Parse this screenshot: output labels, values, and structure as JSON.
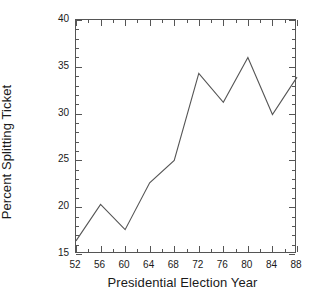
{
  "chart_data": {
    "type": "line",
    "title": "",
    "xlabel": "Presidential Election Year",
    "ylabel": "Percent Splitting Ticket",
    "x": [
      52,
      56,
      60,
      64,
      68,
      72,
      76,
      80,
      84,
      88
    ],
    "categories": [
      "52",
      "56",
      "60",
      "64",
      "68",
      "72",
      "76",
      "80",
      "84",
      "88"
    ],
    "values": [
      16.4,
      20.3,
      17.6,
      22.6,
      25.0,
      34.3,
      31.2,
      36.0,
      29.9,
      33.9
    ],
    "series": [
      {
        "name": "Percent Splitting Ticket",
        "values": [
          16.4,
          20.3,
          17.6,
          22.6,
          25.0,
          34.3,
          31.2,
          36.0,
          29.9,
          33.9
        ]
      }
    ],
    "xlim": [
      52,
      88
    ],
    "ylim": [
      15,
      40
    ],
    "ytick_labels": [
      "15",
      "20",
      "25",
      "30",
      "35",
      "40"
    ],
    "ytick_values": [
      15,
      20,
      25,
      30,
      35,
      40
    ],
    "ytick_minor_step": 1,
    "xtick_labels": [
      "52",
      "56",
      "60",
      "64",
      "68",
      "72",
      "76",
      "80",
      "84",
      "88"
    ],
    "xtick_values": [
      52,
      56,
      60,
      64,
      68,
      72,
      76,
      80,
      84,
      88
    ],
    "xtick_minor_step": 2,
    "grid": false,
    "legend": "none",
    "line_color": "#555555",
    "axis_color": "#555555",
    "background_color": "#ffffff"
  }
}
